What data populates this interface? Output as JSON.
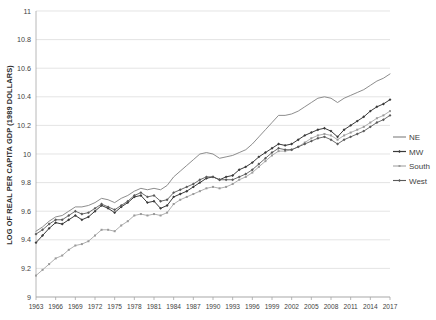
{
  "chart_data": {
    "type": "line",
    "title": "",
    "xlabel": "",
    "ylabel": "LOG OF REAL PER CAPITA GDP (1989 DOLLARS)",
    "ylim": [
      9,
      11
    ],
    "yticks": [
      9,
      9.2,
      9.4,
      9.6,
      9.8,
      10,
      10.2,
      10.4,
      10.6,
      10.8,
      11
    ],
    "ytick_labels": [
      "9",
      "9.2",
      "9.4",
      "9.6",
      "9.8",
      "10",
      "10.2",
      "10.4",
      "10.6",
      "10.8",
      "11"
    ],
    "grid": true,
    "legend_position": "right",
    "xlim": [
      1963,
      2017
    ],
    "x": [
      1963,
      1964,
      1965,
      1966,
      1967,
      1968,
      1969,
      1970,
      1971,
      1972,
      1973,
      1974,
      1975,
      1976,
      1977,
      1978,
      1979,
      1980,
      1981,
      1982,
      1983,
      1984,
      1985,
      1986,
      1987,
      1988,
      1989,
      1990,
      1991,
      1992,
      1993,
      1994,
      1995,
      1996,
      1997,
      1998,
      1999,
      2000,
      2001,
      2002,
      2003,
      2004,
      2005,
      2006,
      2007,
      2008,
      2009,
      2010,
      2011,
      2012,
      2013,
      2014,
      2015,
      2016,
      2017
    ],
    "xtick_labels": [
      "1963",
      "1966",
      "1969",
      "1972",
      "1975",
      "1978",
      "1981",
      "1984",
      "1987",
      "1990",
      "1993",
      "1996",
      "1999",
      "2002",
      "2005",
      "2008",
      "2011",
      "2014",
      "2017"
    ],
    "xticks": [
      1963,
      1966,
      1969,
      1972,
      1975,
      1978,
      1981,
      1984,
      1987,
      1990,
      1993,
      1996,
      1999,
      2002,
      2005,
      2008,
      2011,
      2014,
      2017
    ],
    "series": [
      {
        "name": "NE",
        "color": "#808080",
        "marker": "none",
        "width": 0.9,
        "values": [
          9.46,
          9.49,
          9.53,
          9.56,
          9.57,
          9.6,
          9.63,
          9.63,
          9.64,
          9.66,
          9.69,
          9.68,
          9.66,
          9.69,
          9.71,
          9.74,
          9.76,
          9.75,
          9.76,
          9.75,
          9.78,
          9.84,
          9.88,
          9.92,
          9.96,
          10.0,
          10.01,
          10.0,
          9.97,
          9.98,
          9.99,
          10.01,
          10.03,
          10.07,
          10.12,
          10.17,
          10.22,
          10.27,
          10.27,
          10.28,
          10.3,
          10.33,
          10.36,
          10.39,
          10.4,
          10.39,
          10.36,
          10.39,
          10.41,
          10.43,
          10.45,
          10.48,
          10.51,
          10.53,
          10.56
        ]
      },
      {
        "name": "MW",
        "color": "#3a3a3a",
        "marker": "diamond",
        "width": 1.0,
        "values": [
          9.38,
          9.43,
          9.48,
          9.52,
          9.51,
          9.54,
          9.57,
          9.54,
          9.56,
          9.6,
          9.64,
          9.62,
          9.59,
          9.63,
          9.66,
          9.7,
          9.71,
          9.66,
          9.67,
          9.62,
          9.64,
          9.7,
          9.72,
          9.74,
          9.77,
          9.8,
          9.83,
          9.84,
          9.82,
          9.84,
          9.85,
          9.89,
          9.91,
          9.94,
          9.98,
          10.01,
          10.04,
          10.07,
          10.06,
          10.07,
          10.1,
          10.13,
          10.15,
          10.17,
          10.18,
          10.16,
          10.12,
          10.17,
          10.2,
          10.23,
          10.26,
          10.3,
          10.33,
          10.35,
          10.38
        ]
      },
      {
        "name": "South",
        "color": "#9a9a9a",
        "marker": "small",
        "width": 0.8,
        "values": [
          9.15,
          9.19,
          9.23,
          9.27,
          9.29,
          9.33,
          9.36,
          9.37,
          9.39,
          9.43,
          9.47,
          9.47,
          9.46,
          9.5,
          9.53,
          9.57,
          9.58,
          9.57,
          9.58,
          9.57,
          9.59,
          9.65,
          9.68,
          9.7,
          9.72,
          9.74,
          9.76,
          9.77,
          9.76,
          9.77,
          9.79,
          9.82,
          9.84,
          9.87,
          9.91,
          9.95,
          9.99,
          10.02,
          10.02,
          10.03,
          10.05,
          10.08,
          10.11,
          10.13,
          10.14,
          10.13,
          10.1,
          10.13,
          10.15,
          10.17,
          10.19,
          10.22,
          10.25,
          10.27,
          10.3
        ]
      },
      {
        "name": "West",
        "color": "#5a5a5a",
        "marker": "diamond",
        "width": 0.9,
        "values": [
          9.44,
          9.47,
          9.51,
          9.54,
          9.54,
          9.57,
          9.6,
          9.58,
          9.59,
          9.62,
          9.65,
          9.63,
          9.61,
          9.64,
          9.67,
          9.71,
          9.73,
          9.7,
          9.71,
          9.67,
          9.68,
          9.73,
          9.75,
          9.77,
          9.79,
          9.82,
          9.84,
          9.84,
          9.82,
          9.82,
          9.82,
          9.84,
          9.86,
          9.89,
          9.93,
          9.97,
          10.01,
          10.04,
          10.03,
          10.03,
          10.05,
          10.07,
          10.09,
          10.11,
          10.12,
          10.1,
          10.07,
          10.1,
          10.12,
          10.14,
          10.16,
          10.19,
          10.22,
          10.24,
          10.27
        ]
      }
    ]
  },
  "legend": {
    "items": [
      {
        "label": "NE"
      },
      {
        "label": "MW"
      },
      {
        "label": "South"
      },
      {
        "label": "West"
      }
    ]
  }
}
